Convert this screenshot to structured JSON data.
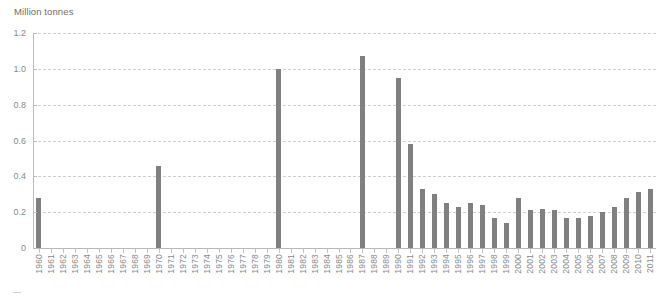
{
  "chart_data": {
    "type": "bar",
    "title": "",
    "ylabel": "Million tonnes",
    "xlabel": "",
    "ylim": [
      0,
      1.2
    ],
    "y_ticks": [
      "0",
      "0.2",
      "0.4",
      "0.6",
      "0.8",
      "1.0",
      "1.2"
    ],
    "y_tick_values": [
      0,
      0.2,
      0.4,
      0.6,
      0.8,
      1.0,
      1.2
    ],
    "grid": "horizontal-dashed",
    "legend": "none",
    "bar_color": "#808080",
    "categories": [
      "1960",
      "1961",
      "1962",
      "1963",
      "1964",
      "1965",
      "1966",
      "1967",
      "1968",
      "1969",
      "1970",
      "1971",
      "1972",
      "1973",
      "1974",
      "1975",
      "1976",
      "1977",
      "1978",
      "1979",
      "1980",
      "1981",
      "1982",
      "1983",
      "1984",
      "1985",
      "1986",
      "1987",
      "1988",
      "1989",
      "1990",
      "1991",
      "1992",
      "1993",
      "1994",
      "1995",
      "1996",
      "1997",
      "1998",
      "1999",
      "2000",
      "2001",
      "2002",
      "2003",
      "2004",
      "2005",
      "2006",
      "2007",
      "2008",
      "2009",
      "2010",
      "2011"
    ],
    "values": [
      0.28,
      0,
      0,
      0,
      0,
      0,
      0,
      0,
      0,
      0,
      0.46,
      0,
      0,
      0,
      0,
      0,
      0,
      0,
      0,
      0,
      1.0,
      0,
      0,
      0,
      0,
      0,
      0,
      1.07,
      0,
      0,
      0.95,
      0.58,
      0.33,
      0.3,
      0.25,
      0.23,
      0.25,
      0.24,
      0.17,
      0.14,
      0.28,
      0.21,
      0.22,
      0.21,
      0.17,
      0.17,
      0.18,
      0.2,
      0.23,
      0.28,
      0.31,
      0.33
    ]
  },
  "colors": {
    "bar": "#808080",
    "gridline": "#cfcfcf",
    "axis": "#b8b8b8",
    "text": "#8a8a8a"
  }
}
